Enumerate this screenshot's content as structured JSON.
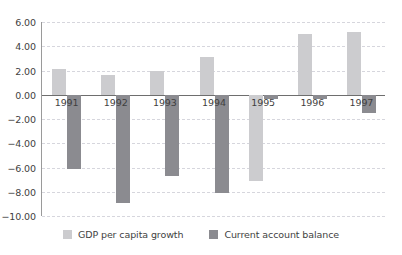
{
  "chart_data": {
    "type": "bar",
    "title": "",
    "subtitle": "",
    "xlabel": "",
    "ylabel": "",
    "categories": [
      "1991",
      "1992",
      "1993",
      "1994",
      "1995",
      "1996",
      "1997"
    ],
    "series": [
      {
        "name": "GDP per capita growth",
        "color": "#cccccf",
        "values": [
          2.1,
          1.6,
          2.0,
          3.1,
          -7.1,
          5.0,
          5.2
        ]
      },
      {
        "name": "Current account balance",
        "color": "#8b8b90",
        "values": [
          -6.1,
          -8.9,
          -6.7,
          -8.1,
          -0.35,
          -0.35,
          -1.5
        ]
      }
    ],
    "ylim": [
      -10.0,
      6.0
    ],
    "ytick_labels": [
      "6.00",
      "4.00",
      "2.00",
      "0.00",
      "-2.00",
      "-4.00",
      "-6.00",
      "-8.00",
      "-10.00"
    ],
    "ytick_values": [
      6.0,
      4.0,
      2.0,
      0.0,
      -2.0,
      -4.0,
      -6.0,
      -8.0,
      -10.0
    ],
    "grid": true,
    "grid_color": "#d6d6dd",
    "zero_line_color": "#6e6e6e",
    "axis_color": "#9a9a9a",
    "legend_position": "bottom",
    "background": "#ffffff"
  }
}
